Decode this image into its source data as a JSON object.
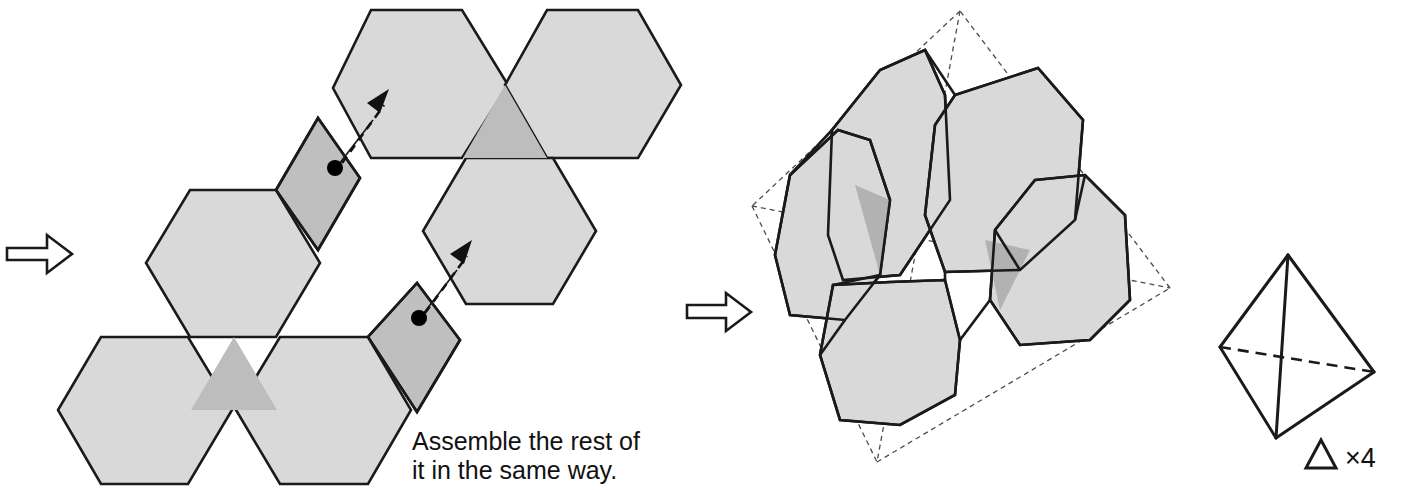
{
  "figure": {
    "background_color": "#ffffff",
    "width": 1402,
    "height": 490
  },
  "colors": {
    "face_light": "#d9d9d9",
    "face_mid": "#bfbfbf",
    "face_white": "#ffffff",
    "outline": "#1a1a1a",
    "dashed_guide": "#4d4d4d",
    "dot": "#000000",
    "text": "#111111"
  },
  "annotations": {
    "caption_line1": "Assemble the rest of",
    "caption_line2": "it in the same way.",
    "multiplier_label": "×4"
  },
  "steps": [
    {
      "name": "step-arrow-left",
      "icon": "right-block-arrow",
      "points": "7,248 47,248 47,235 72,254 47,273 47,260 7,260"
    },
    {
      "name": "step-arrow-middle",
      "icon": "right-block-arrow",
      "points": "687,305 726,305 726,293 751,312 726,331 726,318 687,318"
    }
  ],
  "net": {
    "name": "unfolded-net",
    "hexagons": [
      {
        "id": "hex-top-left",
        "shade": "light",
        "points": "371,10 462,10 508,85 462,158 371,158 333,88"
      },
      {
        "id": "hex-top-right",
        "shade": "light",
        "points": "547,10 638,10 681,85 638,158 547,158 505,85"
      },
      {
        "id": "hex-mid-right",
        "shade": "light",
        "points": "466,158 553,158 596,231 553,304 466,304 423,231"
      },
      {
        "id": "hex-mid-left",
        "shade": "light",
        "points": "190,190 276,190 320,263 276,337 190,337 146,263"
      },
      {
        "id": "hex-bottom-left",
        "shade": "light",
        "points": "101,337 188,337 232,410 188,484 101,484 58,410"
      },
      {
        "id": "hex-bottom-right",
        "shade": "light",
        "points": "280,337 368,337 411,410 368,484 280,484 236,410"
      }
    ],
    "overlap_triangles": [
      {
        "id": "tri-top",
        "shade": "mid",
        "points": "505,85 547,158 463,158"
      },
      {
        "id": "tri-bottom",
        "shade": "mid",
        "points": "234,337 277,410 191,410"
      }
    ],
    "flaps": [
      {
        "id": "flap-upper",
        "shade": "mid",
        "points": "318,118 360,178 318,250 276,190 276,190"
      },
      {
        "id": "flap-lower",
        "shade": "mid",
        "points": "417,283 460,340 417,412 368,337 368,337"
      }
    ],
    "fold_arrows": [
      {
        "id": "fold-arrow-upper",
        "connector": "336,168 373,120",
        "dashed": "342,163 384,105",
        "head": "389,89 380,113 367,103"
      },
      {
        "id": "fold-arrow-lower",
        "connector": "420,318 457,270",
        "dashed": "425,313 467,256",
        "head": "472,240 464,264 450,254"
      }
    ],
    "dots": [
      {
        "id": "fold-dot-upper",
        "cx": 335,
        "cy": 168,
        "r": 8
      },
      {
        "id": "fold-dot-lower",
        "cx": 419,
        "cy": 318,
        "r": 8
      }
    ]
  },
  "assembled": {
    "name": "assembled-truncated-tetrahedron",
    "guide_outline": {
      "id": "dashed-tetrahedron-frame",
      "vertices": {
        "top": "960,11",
        "left": "752,206",
        "right": "1170,288",
        "bottom": "877,462"
      },
      "edges": [
        "960,11 752,206",
        "752,206 877,462",
        "877,462 1170,288",
        "1170,288 960,11",
        "960,11 877,462",
        "752,206 1170,288"
      ]
    },
    "faces": [
      {
        "id": "face-upper-left-hex",
        "shade": "light",
        "points": "925,50 945,95 950,200 900,275 843,280 828,235 832,130 880,70"
      },
      {
        "id": "face-upper-right-hex",
        "shade": "light",
        "points": "955,95 1038,68 1083,120 1075,220 1020,270 945,272 925,215 935,125"
      },
      {
        "id": "face-left-hex",
        "shade": "light",
        "points": "838,130 790,175 775,255 790,315 845,320 880,275 890,200 870,140"
      },
      {
        "id": "face-center-lower-hex",
        "shade": "light",
        "points": "833,285 890,282 945,280 960,340 955,395 900,425 840,420 820,355"
      },
      {
        "id": "face-right-hex",
        "shade": "light",
        "points": "1035,180 1085,175 1125,215 1130,300 1090,340 1020,345 990,300 995,230"
      }
    ],
    "shading_detail": [
      {
        "id": "shade-left-triangle",
        "shade": "dark",
        "points": "855,185 890,200 880,275"
      },
      {
        "id": "shade-right-triangle",
        "shade": "dark",
        "points": "985,240 1030,250 1000,310"
      }
    ],
    "edge_paths": [
      "925,50 880,70",
      "880,70 832,130",
      "832,130 828,235",
      "828,235 843,280",
      "843,280 900,275",
      "900,275 950,200",
      "950,200 945,95",
      "945,95 925,50",
      "955,95 1038,68",
      "1038,68 1083,120",
      "1083,120 1075,220",
      "1075,220 1020,270",
      "1020,270 945,272",
      "945,272 925,215",
      "925,215 935,125",
      "935,125 955,95",
      "838,130 790,175",
      "790,175 775,255",
      "775,255 790,315",
      "790,315 845,320",
      "845,320 880,275",
      "880,275 890,200",
      "890,200 870,140",
      "870,140 838,130",
      "833,285 890,282",
      "890,282 945,280",
      "945,280 960,340",
      "960,340 955,395",
      "955,395 900,425",
      "900,425 840,420",
      "840,420 820,355",
      "820,355 833,285",
      "1035,180 1085,175",
      "1085,175 1125,215",
      "1125,215 1130,300",
      "1130,300 1090,340",
      "1090,340 1020,345",
      "1020,345 990,300",
      "990,300 995,230",
      "995,230 1035,180"
    ]
  },
  "tetrahedron": {
    "name": "reference-tetrahedron",
    "vertices": {
      "apex": "1288,255",
      "left": "1220,347",
      "right": "1374,372",
      "bottom": "1276,438"
    },
    "solid_edges": [
      "1288,255 1220,347",
      "1288,255 1374,372",
      "1288,255 1276,438",
      "1220,347 1276,438",
      "1276,438 1374,372"
    ],
    "hidden_edges": [
      "1220,347 1374,372"
    ],
    "mini_triangle": {
      "id": "mini-triangle-glyph",
      "points": "1306,468 1336,468 1321,440"
    },
    "multiplier_position": {
      "x": 1345,
      "y": 466
    }
  }
}
